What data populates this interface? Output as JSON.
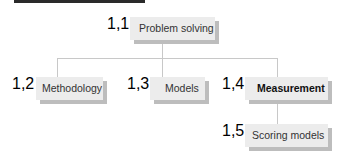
{
  "diagram": {
    "nodes": [
      {
        "id": "1.1",
        "number": "1,1",
        "label": "Problem solving",
        "emphasis": false
      },
      {
        "id": "1.2",
        "number": "1,2",
        "label": "Methodology",
        "emphasis": false
      },
      {
        "id": "1.3",
        "number": "1,3",
        "label": "Models",
        "emphasis": false
      },
      {
        "id": "1.4",
        "number": "1,4",
        "label": "Measurement",
        "emphasis": true
      },
      {
        "id": "1.5",
        "number": "1,5",
        "label": "Scoring models",
        "emphasis": false
      }
    ],
    "edges": [
      {
        "from": "1.1",
        "to": "1.2"
      },
      {
        "from": "1.1",
        "to": "1.3"
      },
      {
        "from": "1.1",
        "to": "1.4"
      },
      {
        "from": "1.4",
        "to": "1.5"
      }
    ],
    "colors": {
      "box": "#ececec",
      "shadow": "#bdbdbd",
      "number": "#a3a3a3",
      "connector": "#c8c8c8"
    }
  }
}
